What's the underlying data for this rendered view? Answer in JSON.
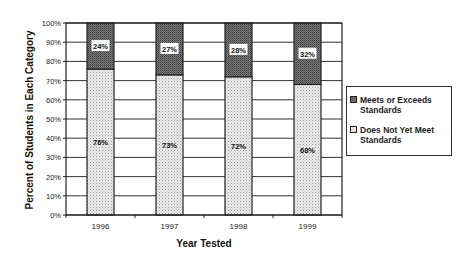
{
  "chart_data": {
    "type": "bar",
    "stacked": true,
    "title": "",
    "xlabel": "Year Tested",
    "ylabel": "Percent of Students in Each Category",
    "categories": [
      "1996",
      "1997",
      "1998",
      "1999"
    ],
    "series": [
      {
        "name": "Does Not Yet Meet Standards",
        "values": [
          76,
          73,
          72,
          68
        ],
        "labels": [
          "76%",
          "73%",
          "72%",
          "68%"
        ],
        "color": "#e6e6e6"
      },
      {
        "name": "Meets or Exceeds Standards",
        "values": [
          24,
          27,
          28,
          32
        ],
        "labels": [
          "24%",
          "27%",
          "28%",
          "32%"
        ],
        "color": "#6b6b6b"
      }
    ],
    "yticks": [
      "0%",
      "10%",
      "20%",
      "30%",
      "40%",
      "50%",
      "60%",
      "70%",
      "80%",
      "90%",
      "100%"
    ],
    "ylim": [
      0,
      100
    ],
    "grid": true,
    "legend_position": "right"
  },
  "legend": {
    "items": [
      {
        "label": "Meets or Exceeds Standards"
      },
      {
        "label": "Does Not Yet Meet Standards"
      }
    ]
  }
}
